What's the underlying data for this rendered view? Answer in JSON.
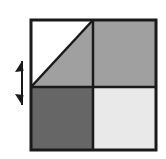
{
  "figure": {
    "title": "Square divided into four quadrants with diagonal and vertical double-headed arrow",
    "background_color": "#ffffff",
    "canvas": {
      "width": 166,
      "height": 159
    }
  },
  "square": {
    "label": "outer-square",
    "x": 31,
    "y": 20,
    "width": 125,
    "height": 130,
    "stroke_color": "#1a1a1a",
    "stroke_width": 3,
    "center_x": 93,
    "center_y": 87
  },
  "quadrants": [
    {
      "name": "top-left-upper-triangle",
      "position": "top-left",
      "shape": "triangle",
      "fill_color": "#ffffff",
      "fill_label": "white",
      "points": "31,20 93,20 31,87"
    },
    {
      "name": "top-left-lower-triangle",
      "position": "top-left",
      "shape": "triangle",
      "fill_color": "#a0a0a0",
      "fill_label": "medium gray",
      "points": "93,20 93,87 31,87"
    },
    {
      "name": "top-right-quadrant",
      "position": "top-right",
      "shape": "rectangle",
      "fill_color": "#a0a0a0",
      "fill_label": "medium gray",
      "x": 93,
      "y": 20,
      "width": 63,
      "height": 67
    },
    {
      "name": "bottom-left-quadrant",
      "position": "bottom-left",
      "shape": "rectangle",
      "fill_color": "#666666",
      "fill_label": "dark gray",
      "x": 31,
      "y": 87,
      "width": 62,
      "height": 63
    },
    {
      "name": "bottom-right-quadrant",
      "position": "bottom-right",
      "shape": "rectangle",
      "fill_color": "#e9e9e9",
      "fill_label": "very light gray",
      "x": 93,
      "y": 87,
      "width": 63,
      "height": 63
    }
  ],
  "dividers": {
    "vertical": {
      "name": "vertical-divider",
      "x1": 93,
      "y1": 20,
      "x2": 93,
      "y2": 150,
      "color": "#1a1a1a",
      "width": 2.5
    },
    "horizontal": {
      "name": "horizontal-divider",
      "x1": 31,
      "y1": 87,
      "x2": 156,
      "y2": 87,
      "color": "#1a1a1a",
      "width": 2.5
    },
    "diagonal": {
      "name": "diagonal-line",
      "x1": 93,
      "y1": 20,
      "x2": 31,
      "y2": 87,
      "color": "#1a1a1a",
      "width": 2.5
    }
  },
  "arrow": {
    "name": "vertical-double-headed-arrow",
    "direction": "vertical",
    "heads": "both",
    "color": "#1a1a1a",
    "x": 22,
    "top_y": 61,
    "bottom_y": 105,
    "stem_width": 2
  }
}
